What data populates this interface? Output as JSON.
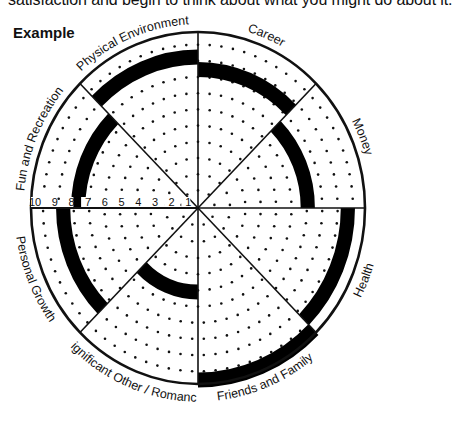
{
  "intro_text": "satisfaction and begin to think about what you might do about it.",
  "heading": "Example",
  "wheel": {
    "center": [
      198,
      208
    ],
    "radius_x": 167,
    "radius_y": 176,
    "max_score": 10,
    "ring_labels": [
      "10",
      "9",
      "8",
      "7",
      "6",
      "5",
      "4",
      "3",
      "2",
      "1"
    ],
    "band_color": "#000000",
    "segments": [
      {
        "label": "Career",
        "score": 8.3
      },
      {
        "label": "Money",
        "score": 7
      },
      {
        "label": "Health",
        "score": 9.4
      },
      {
        "label": "Friends and Family",
        "score": 10.2
      },
      {
        "label": "Significant Other / Romance",
        "score": 5.2
      },
      {
        "label": "Personal Growth",
        "score": 8.5
      },
      {
        "label": "Fun and Recreation",
        "score": 7.6
      },
      {
        "label": "Physical Environment",
        "score": 9
      }
    ]
  },
  "chart_data": {
    "type": "radial-wheel",
    "title": "Example",
    "categories": [
      "Career",
      "Money",
      "Health",
      "Friends and Family",
      "Significant Other / Romance",
      "Personal Growth",
      "Fun and Recreation",
      "Physical Environment"
    ],
    "values": [
      8,
      7,
      9,
      10,
      5,
      8,
      8,
      9
    ],
    "scale": [
      1,
      10
    ],
    "tick_labels": [
      "10",
      "9",
      "8",
      "7",
      "6",
      "5",
      "4",
      "3",
      "2",
      "1"
    ]
  }
}
